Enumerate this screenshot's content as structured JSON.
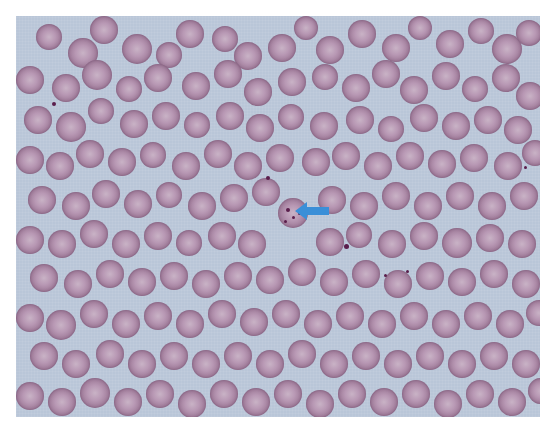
{
  "image": {
    "type": "blood smear micrograph",
    "background_color": "#b9c6d8",
    "cell_color": "#a8849f",
    "annotation": {
      "shape": "arrow",
      "color": "#3a8fd8",
      "direction": "left",
      "points_to": "infected red blood cell with ring-form parasites"
    }
  },
  "cells": [
    [
      20,
      8,
      26
    ],
    [
      52,
      22,
      30
    ],
    [
      74,
      0,
      28
    ],
    [
      106,
      18,
      30
    ],
    [
      140,
      26,
      26
    ],
    [
      160,
      4,
      28
    ],
    [
      196,
      10,
      26
    ],
    [
      218,
      26,
      28
    ],
    [
      252,
      18,
      28
    ],
    [
      278,
      0,
      24
    ],
    [
      300,
      20,
      28
    ],
    [
      332,
      4,
      28
    ],
    [
      366,
      18,
      28
    ],
    [
      392,
      0,
      24
    ],
    [
      420,
      14,
      28
    ],
    [
      452,
      2,
      26
    ],
    [
      476,
      18,
      30
    ],
    [
      500,
      4,
      26
    ],
    [
      0,
      50,
      28
    ],
    [
      36,
      58,
      28
    ],
    [
      66,
      44,
      30
    ],
    [
      100,
      60,
      26
    ],
    [
      128,
      48,
      28
    ],
    [
      166,
      56,
      28
    ],
    [
      198,
      44,
      28
    ],
    [
      228,
      62,
      28
    ],
    [
      262,
      52,
      28
    ],
    [
      296,
      48,
      26
    ],
    [
      326,
      58,
      28
    ],
    [
      356,
      44,
      28
    ],
    [
      384,
      60,
      28
    ],
    [
      416,
      46,
      28
    ],
    [
      446,
      60,
      26
    ],
    [
      476,
      48,
      28
    ],
    [
      500,
      66,
      28
    ],
    [
      8,
      90,
      28
    ],
    [
      40,
      96,
      30
    ],
    [
      72,
      82,
      26
    ],
    [
      104,
      94,
      28
    ],
    [
      136,
      86,
      28
    ],
    [
      168,
      96,
      26
    ],
    [
      200,
      86,
      28
    ],
    [
      230,
      98,
      28
    ],
    [
      262,
      88,
      26
    ],
    [
      294,
      96,
      28
    ],
    [
      330,
      90,
      28
    ],
    [
      362,
      100,
      26
    ],
    [
      394,
      88,
      28
    ],
    [
      426,
      96,
      28
    ],
    [
      458,
      90,
      28
    ],
    [
      488,
      100,
      28
    ],
    [
      0,
      130,
      28
    ],
    [
      30,
      136,
      28
    ],
    [
      60,
      124,
      28
    ],
    [
      92,
      132,
      28
    ],
    [
      124,
      126,
      26
    ],
    [
      156,
      136,
      28
    ],
    [
      188,
      124,
      28
    ],
    [
      218,
      136,
      28
    ],
    [
      250,
      128,
      28
    ],
    [
      286,
      132,
      28
    ],
    [
      316,
      126,
      28
    ],
    [
      348,
      136,
      28
    ],
    [
      380,
      126,
      28
    ],
    [
      412,
      134,
      28
    ],
    [
      444,
      128,
      28
    ],
    [
      478,
      136,
      28
    ],
    [
      506,
      124,
      26
    ],
    [
      12,
      170,
      28
    ],
    [
      46,
      176,
      28
    ],
    [
      76,
      164,
      28
    ],
    [
      108,
      174,
      28
    ],
    [
      140,
      166,
      26
    ],
    [
      172,
      176,
      28
    ],
    [
      204,
      168,
      28
    ],
    [
      236,
      162,
      28
    ],
    [
      302,
      170,
      28
    ],
    [
      334,
      176,
      28
    ],
    [
      366,
      166,
      28
    ],
    [
      398,
      176,
      28
    ],
    [
      430,
      166,
      28
    ],
    [
      462,
      176,
      28
    ],
    [
      494,
      166,
      28
    ],
    [
      0,
      210,
      28
    ],
    [
      32,
      214,
      28
    ],
    [
      64,
      204,
      28
    ],
    [
      96,
      214,
      28
    ],
    [
      128,
      206,
      28
    ],
    [
      160,
      214,
      26
    ],
    [
      192,
      206,
      28
    ],
    [
      222,
      214,
      28
    ],
    [
      300,
      212,
      28
    ],
    [
      330,
      206,
      26
    ],
    [
      362,
      214,
      28
    ],
    [
      394,
      206,
      28
    ],
    [
      426,
      212,
      30
    ],
    [
      460,
      208,
      28
    ],
    [
      492,
      214,
      28
    ],
    [
      14,
      248,
      28
    ],
    [
      48,
      254,
      28
    ],
    [
      80,
      244,
      28
    ],
    [
      112,
      252,
      28
    ],
    [
      144,
      246,
      28
    ],
    [
      176,
      254,
      28
    ],
    [
      208,
      246,
      28
    ],
    [
      240,
      250,
      28
    ],
    [
      272,
      242,
      28
    ],
    [
      304,
      252,
      28
    ],
    [
      336,
      244,
      28
    ],
    [
      368,
      254,
      28
    ],
    [
      400,
      246,
      28
    ],
    [
      432,
      252,
      28
    ],
    [
      464,
      244,
      28
    ],
    [
      496,
      254,
      28
    ],
    [
      0,
      288,
      28
    ],
    [
      30,
      294,
      30
    ],
    [
      64,
      284,
      28
    ],
    [
      96,
      294,
      28
    ],
    [
      128,
      286,
      28
    ],
    [
      160,
      294,
      28
    ],
    [
      192,
      284,
      28
    ],
    [
      224,
      292,
      28
    ],
    [
      256,
      284,
      28
    ],
    [
      288,
      294,
      28
    ],
    [
      320,
      286,
      28
    ],
    [
      352,
      294,
      28
    ],
    [
      384,
      286,
      28
    ],
    [
      416,
      294,
      28
    ],
    [
      448,
      286,
      28
    ],
    [
      480,
      294,
      28
    ],
    [
      510,
      284,
      26
    ],
    [
      14,
      326,
      28
    ],
    [
      46,
      334,
      28
    ],
    [
      80,
      324,
      28
    ],
    [
      112,
      334,
      28
    ],
    [
      144,
      326,
      28
    ],
    [
      176,
      334,
      28
    ],
    [
      208,
      326,
      28
    ],
    [
      240,
      334,
      28
    ],
    [
      272,
      324,
      28
    ],
    [
      304,
      334,
      28
    ],
    [
      336,
      326,
      28
    ],
    [
      368,
      334,
      28
    ],
    [
      400,
      326,
      28
    ],
    [
      432,
      334,
      28
    ],
    [
      464,
      326,
      28
    ],
    [
      496,
      334,
      28
    ],
    [
      0,
      366,
      28
    ],
    [
      32,
      372,
      28
    ],
    [
      64,
      362,
      30
    ],
    [
      98,
      372,
      28
    ],
    [
      130,
      364,
      28
    ],
    [
      162,
      374,
      28
    ],
    [
      194,
      364,
      28
    ],
    [
      226,
      372,
      28
    ],
    [
      258,
      364,
      28
    ],
    [
      290,
      374,
      28
    ],
    [
      322,
      364,
      28
    ],
    [
      354,
      372,
      28
    ],
    [
      386,
      364,
      28
    ],
    [
      418,
      374,
      28
    ],
    [
      450,
      364,
      28
    ],
    [
      482,
      372,
      28
    ],
    [
      512,
      362,
      26
    ]
  ],
  "infected_cell": [
    262,
    182,
    30
  ],
  "parasites": [
    [
      270,
      192,
      4
    ],
    [
      276,
      200,
      3
    ],
    [
      268,
      204,
      3
    ],
    [
      282,
      196,
      3
    ],
    [
      250,
      160,
      4
    ],
    [
      328,
      228,
      5
    ],
    [
      36,
      86,
      4
    ],
    [
      368,
      258,
      3
    ],
    [
      390,
      254,
      3
    ],
    [
      508,
      150,
      3
    ]
  ]
}
